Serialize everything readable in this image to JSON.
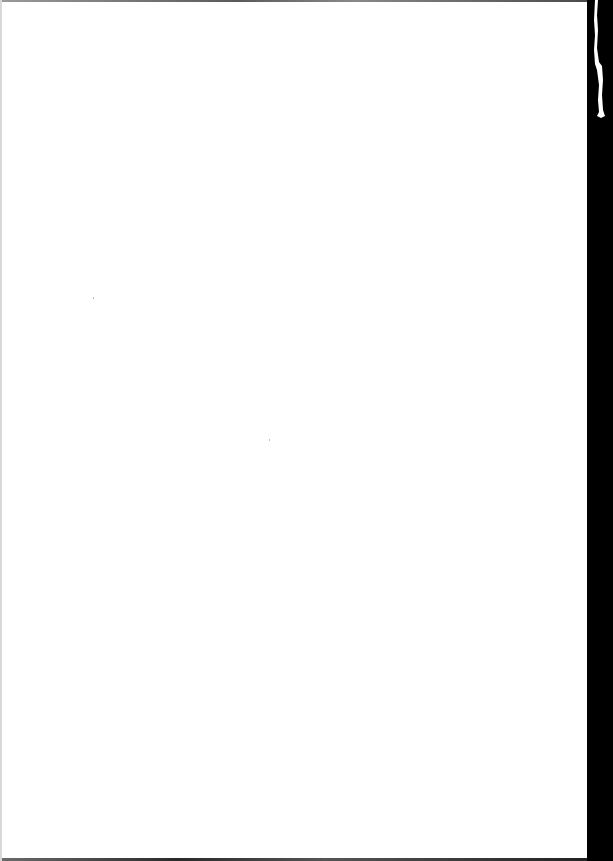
{
  "document": {
    "type": "blank scanned page",
    "text": "",
    "colors": {
      "paper": "#ffffff",
      "scan_background": "#000000",
      "edge_shadow": "#5a5a5a"
    }
  }
}
